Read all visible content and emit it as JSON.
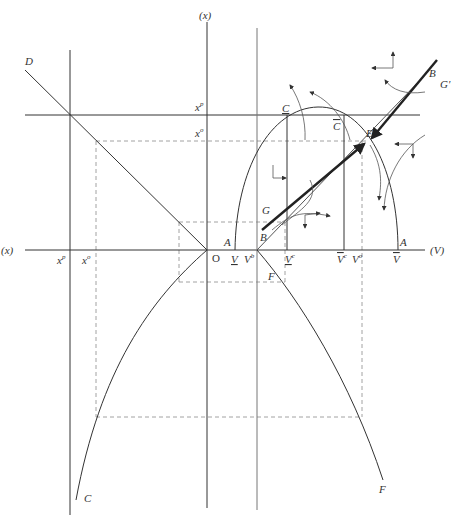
{
  "figure": {
    "type": "phase-diagram",
    "axes": {
      "horizontal_label": "(V)",
      "horizontal_left_label": "(x)",
      "vertical_label": "(x)",
      "origin_label": "O"
    },
    "colors": {
      "line": "#333333",
      "light_line": "#777777",
      "dashed": "#8a8a8a",
      "background": "#ffffff"
    },
    "labels": {
      "D": "D",
      "C_bottom": "C",
      "F_bottom": "F",
      "F_mid": "F",
      "C_under": "C",
      "C_bar": "C",
      "E": "E",
      "B_top": "B",
      "G_prime": "G'",
      "G": "G",
      "B_low": "B",
      "A_left": "A",
      "A_right": "A",
      "xp_top": "x",
      "xp_top_sup": "p",
      "xo_top": "x",
      "xo_top_sup": "o",
      "xp_axis": "x",
      "xp_axis_sup": "p",
      "xo_axis": "x",
      "xo_axis_sup": "o",
      "V_under": "V",
      "Vb": "V",
      "Vb_sup": "b",
      "Vc_under": "V",
      "Vc_under_sup": "c",
      "Vc_bar": "V",
      "Vc_bar_sup": "c",
      "Vo": "V",
      "Vo_sup": "o",
      "V_bar": "V"
    }
  }
}
